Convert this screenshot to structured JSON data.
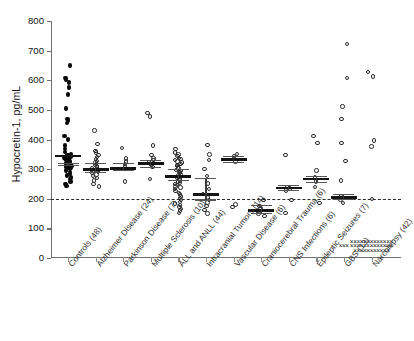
{
  "chart_data": {
    "type": "scatter",
    "title": "",
    "xlabel": "",
    "ylabel": "Hypocretin-1, pg/mL",
    "ylim": [
      0,
      800
    ],
    "yticks": [
      0,
      100,
      200,
      300,
      400,
      500,
      600,
      700,
      800
    ],
    "ytick_labels": [
      "0",
      "100",
      "200",
      "300",
      "400",
      "500",
      "600",
      "700",
      "800"
    ],
    "grid": false,
    "legend": "none",
    "reference_line": {
      "value": 200,
      "style": "dashed",
      "label": ""
    },
    "marker_styles": {
      "controls": "filled-circle",
      "disease": "open-circle",
      "undetectable": "cross"
    },
    "categories": [
      "Controls (48)",
      "Alzheimer Disease (24)",
      "Parkinson Disease (7)",
      "Multiple Sclerosis (10)",
      "ALL and ANLL (44)",
      "Intracranial Tumors (14)",
      "Vascular Disease (6)",
      "Craniocerebral Trauma (6)",
      "CNS Infections (6)",
      "Epileptic Seizures (7)",
      "GBS (13)",
      "Narcolepsy (42)"
    ],
    "groups": [
      {
        "name": "Controls (48)",
        "n": 48,
        "marker": "filled-circle",
        "mean": 344,
        "sd_upper": 318,
        "sd_lower": 312,
        "values": [
          650,
          607,
          600,
          593,
          575,
          552,
          505,
          470,
          462,
          455,
          412,
          400,
          380,
          368,
          358,
          352,
          348,
          345,
          342,
          340,
          338,
          336,
          334,
          332,
          330,
          328,
          326,
          324,
          322,
          320,
          318,
          316,
          314,
          312,
          310,
          308,
          306,
          304,
          300,
          296,
          290,
          284,
          278,
          272,
          266,
          258,
          250,
          244
        ]
      },
      {
        "name": "Alzheimer Disease (24)",
        "n": 24,
        "marker": "open-circle",
        "mean": 298,
        "sd_upper": 320,
        "sd_lower": 290,
        "values": [
          430,
          385,
          362,
          356,
          348,
          340,
          334,
          328,
          322,
          318,
          314,
          310,
          306,
          302,
          298,
          294,
          290,
          286,
          282,
          276,
          270,
          262,
          250,
          242
        ]
      },
      {
        "name": "Parkinson Disease (7)",
        "n": 7,
        "marker": "open-circle",
        "mean": 302,
        "sd_upper": 318,
        "sd_lower": 296,
        "values": [
          372,
          336,
          326,
          318,
          310,
          300,
          258
        ]
      },
      {
        "name": "Multiple Sclerosis (10)",
        "n": 10,
        "marker": "open-circle",
        "mean": 318,
        "sd_upper": 330,
        "sd_lower": 306,
        "values": [
          490,
          478,
          380,
          348,
          336,
          330,
          322,
          316,
          308,
          266
        ]
      },
      {
        "name": "ALL and ANLL (44)",
        "n": 44,
        "marker": "open-circle",
        "mean": 276,
        "sd_upper": 300,
        "sd_lower": 262,
        "values": [
          368,
          356,
          350,
          344,
          338,
          334,
          330,
          326,
          322,
          318,
          314,
          310,
          306,
          302,
          298,
          294,
          290,
          286,
          282,
          278,
          274,
          270,
          266,
          262,
          258,
          254,
          250,
          246,
          242,
          238,
          232,
          226,
          220,
          214,
          208,
          202,
          196,
          190,
          184,
          178,
          172,
          166,
          160,
          152
        ]
      },
      {
        "name": "Intracranial Tumors (14)",
        "n": 14,
        "marker": "open-circle",
        "mean": 214,
        "sd_upper": 268,
        "sd_lower": 196,
        "values": [
          382,
          350,
          330,
          300,
          276,
          252,
          232,
          216,
          204,
          196,
          188,
          176,
          162,
          150
        ]
      },
      {
        "name": "Vascular Disease (6)",
        "n": 6,
        "marker": "open-circle",
        "mean": 332,
        "sd_upper": 344,
        "sd_lower": 322,
        "values": [
          352,
          342,
          334,
          326,
          180,
          172
        ]
      },
      {
        "name": "Craniocerebral Trauma (6)",
        "n": 6,
        "marker": "open-circle",
        "mean": 160,
        "sd_upper": 176,
        "sd_lower": 150,
        "values": [
          196,
          176,
          168,
          158,
          150,
          142
        ]
      },
      {
        "name": "CNS Infections (6)",
        "n": 6,
        "marker": "open-circle",
        "mean": 236,
        "sd_upper": 244,
        "sd_lower": 228,
        "values": [
          348,
          240,
          234,
          228,
          196,
          152
        ]
      },
      {
        "name": "Epileptic Seizures (7)",
        "n": 7,
        "marker": "open-circle",
        "mean": 266,
        "sd_upper": 276,
        "sd_lower": 256,
        "values": [
          412,
          388,
          296,
          272,
          258,
          240,
          186
        ]
      },
      {
        "name": "GBS (13)",
        "n": 13,
        "marker": "open-circle",
        "mean": 204,
        "sd_upper": 214,
        "sd_lower": 198,
        "values": [
          722,
          608,
          512,
          470,
          388,
          328,
          262,
          210,
          198,
          186
        ],
        "undetectable_count": 3,
        "undetectable_value": 40
      },
      {
        "name": "Narcolepsy (42)",
        "n": 42,
        "marker": "cross",
        "mean": null,
        "values": [
          628,
          612,
          396,
          376,
          200
        ],
        "undetectable_count": 37,
        "undetectable_value": 40
      }
    ]
  }
}
